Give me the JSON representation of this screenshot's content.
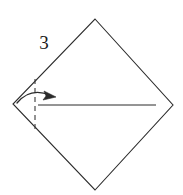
{
  "figure": {
    "kind": "origami-fold-diagram",
    "background_color": "#ffffff",
    "line_color": "#2b2b2b",
    "step_label": "3",
    "shape": {
      "name": "diamond-square",
      "stroke_width": 1.1,
      "vertices": {
        "top": [
          95,
          19
        ],
        "right": [
          173,
          105
        ],
        "bottom": [
          95,
          190
        ],
        "left": [
          13,
          104
        ]
      }
    },
    "fold_line": {
      "name": "vertical-dashed-fold-line",
      "style": "dashed",
      "dash_pattern": "5 4",
      "x": 35,
      "y_top": 79,
      "y_bottom": 131
    },
    "crease_line": {
      "name": "horizontal-solid-crease-line",
      "style": "solid",
      "y": 105,
      "x_start": 38,
      "x_end": 156
    },
    "fold_arrow": {
      "name": "curved-fold-arrow",
      "direction": "left-to-right",
      "start": [
        17,
        103
      ],
      "control": [
        32,
        88
      ],
      "end": [
        55,
        96
      ],
      "arrowhead_size": 9
    }
  }
}
